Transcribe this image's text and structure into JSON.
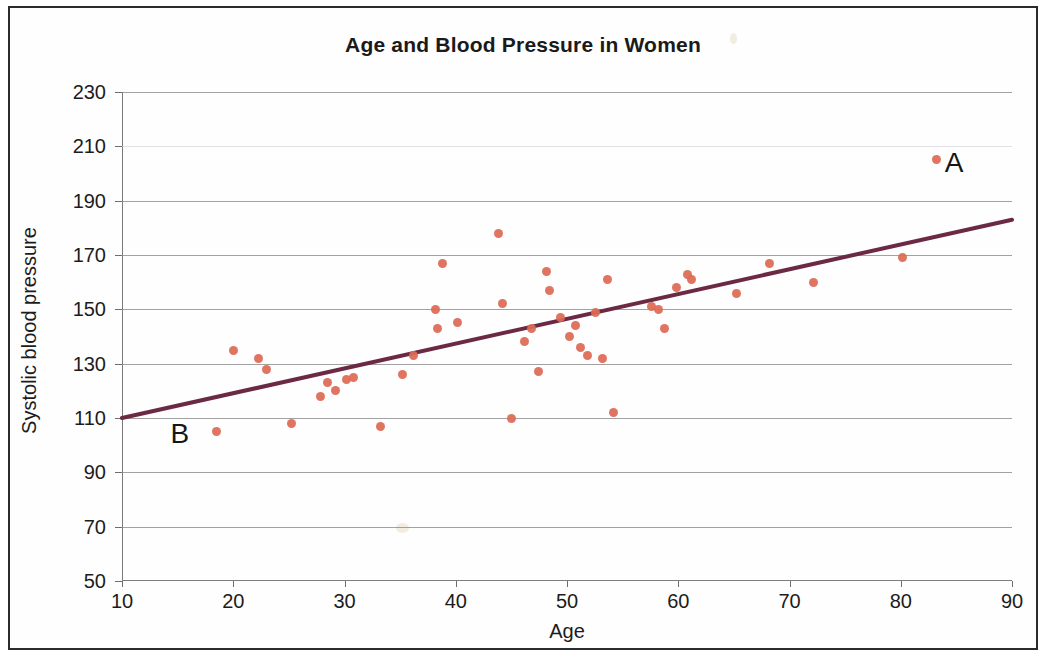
{
  "chart_data": {
    "type": "scatter",
    "title": "Age and Blood Pressure in Women",
    "xlabel": "Age",
    "ylabel": "Systolic blood pressure",
    "xlim": [
      10,
      90
    ],
    "ylim": [
      50,
      230
    ],
    "xticks": [
      10,
      20,
      30,
      40,
      50,
      60,
      70,
      80,
      90
    ],
    "yticks": [
      50,
      70,
      90,
      110,
      130,
      150,
      170,
      190,
      210,
      230
    ],
    "grid": true,
    "legend": "none",
    "point_color": "#dd6a55",
    "trendline_color": "#6b2943",
    "series": [
      {
        "name": "Women",
        "points": [
          [
            18.5,
            105
          ],
          [
            20.0,
            135
          ],
          [
            22.3,
            132
          ],
          [
            23.0,
            128
          ],
          [
            25.2,
            108
          ],
          [
            27.8,
            118
          ],
          [
            28.5,
            123
          ],
          [
            29.2,
            120
          ],
          [
            30.2,
            124
          ],
          [
            30.8,
            125
          ],
          [
            33.2,
            107
          ],
          [
            35.2,
            126
          ],
          [
            36.2,
            133
          ],
          [
            38.2,
            150
          ],
          [
            38.4,
            143
          ],
          [
            38.8,
            167
          ],
          [
            40.2,
            145
          ],
          [
            43.8,
            178
          ],
          [
            44.2,
            152
          ],
          [
            45.0,
            110
          ],
          [
            46.2,
            138
          ],
          [
            46.8,
            143
          ],
          [
            47.4,
            127
          ],
          [
            48.2,
            164
          ],
          [
            48.4,
            157
          ],
          [
            49.4,
            147
          ],
          [
            50.2,
            140
          ],
          [
            50.8,
            144
          ],
          [
            51.2,
            136
          ],
          [
            51.8,
            133
          ],
          [
            52.6,
            149
          ],
          [
            53.2,
            132
          ],
          [
            53.6,
            161
          ],
          [
            54.2,
            112
          ],
          [
            57.6,
            151
          ],
          [
            58.2,
            150
          ],
          [
            58.8,
            143
          ],
          [
            59.8,
            158
          ],
          [
            60.8,
            163
          ],
          [
            61.2,
            161
          ],
          [
            65.2,
            156
          ],
          [
            68.2,
            167
          ],
          [
            72.2,
            160
          ],
          [
            80.2,
            169
          ],
          [
            83.2,
            205
          ]
        ]
      }
    ],
    "trendline": {
      "x0": 10,
      "y0": 110,
      "x1": 90,
      "y1": 183
    },
    "annotations": [
      {
        "label": "A",
        "x": 84.8,
        "y": 204
      },
      {
        "label": "B",
        "x": 15.2,
        "y": 104
      }
    ]
  }
}
